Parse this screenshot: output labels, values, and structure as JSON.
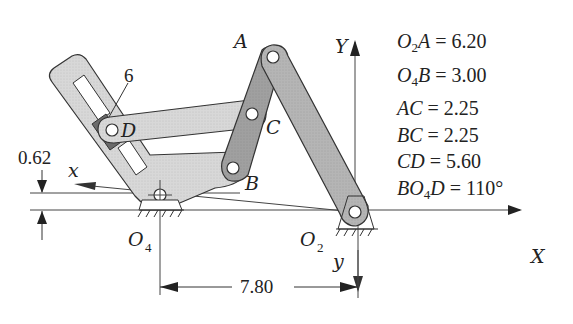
{
  "diagram": {
    "type": "linkage-mechanism",
    "colors": {
      "link_light": "#d6d6d6",
      "link_mid": "#bdbdbd",
      "link_dark": "#9a9a9a",
      "slider_block": "#6e6e6e",
      "outline": "#333333"
    },
    "points": {
      "A": "A",
      "B": "B",
      "C": "C",
      "D": "D",
      "O2": {
        "base": "O",
        "sub": "2"
      },
      "O4": {
        "base": "O",
        "sub": "4"
      }
    },
    "slider_label": "6",
    "axes": {
      "global_x": "X",
      "global_y": "Y",
      "local_x": "x",
      "local_y": "y"
    },
    "dimensions": {
      "offset": "0.62",
      "ground_distance": "7.80"
    },
    "parameters": [
      {
        "lhs_base": "O",
        "lhs_sub": "2",
        "lhs_rest": "A",
        "value": "= 6.20"
      },
      {
        "lhs_base": "O",
        "lhs_sub": "4",
        "lhs_rest": "B",
        "value": "= 3.00"
      },
      {
        "lhs_base": "AC",
        "lhs_sub": "",
        "lhs_rest": "",
        "value": "= 2.25"
      },
      {
        "lhs_base": "BC",
        "lhs_sub": "",
        "lhs_rest": "",
        "value": "= 2.25"
      },
      {
        "lhs_base": "CD",
        "lhs_sub": "",
        "lhs_rest": "",
        "value": "= 5.60"
      },
      {
        "lhs_base": "BO",
        "lhs_sub": "4",
        "lhs_rest": "D",
        "value": "= 110°"
      }
    ]
  }
}
